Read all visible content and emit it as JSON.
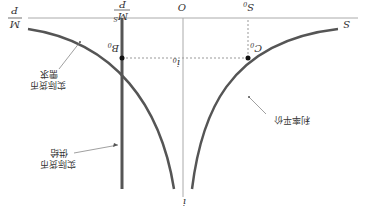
{
  "diagram": {
    "orientation": "rotated-180",
    "axes": {
      "horizontal_label": "S",
      "vertical_label": "i",
      "origin_label": "O",
      "left_axis_label": "M/P"
    },
    "markers": {
      "s0": {
        "main": "S",
        "sub": "0"
      },
      "i0": {
        "main": "i",
        "sub": "0"
      },
      "ms_over_p": {
        "num": "M",
        "num_sup": "S",
        "den": "P"
      },
      "m_over_p": {
        "num": "M",
        "den": "P"
      }
    },
    "points": {
      "b0": {
        "main": "B",
        "sub": "0"
      },
      "c0": {
        "main": "C",
        "sub": "0"
      }
    },
    "labels": {
      "money_demand": [
        "实际货币",
        "需求"
      ],
      "money_supply": [
        "实际货币",
        "供给"
      ],
      "interest_parity": "利率平价"
    },
    "colors": {
      "curve": "#555555",
      "axis": "#aaaaaa",
      "text": "#333333"
    }
  }
}
